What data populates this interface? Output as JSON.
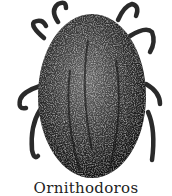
{
  "illustration": {
    "subject": "tick (Ornithodoros) engraving",
    "ink_color": "#1a1a1a",
    "background": "#ffffff"
  },
  "caption": {
    "text": "Ornithodoros"
  }
}
